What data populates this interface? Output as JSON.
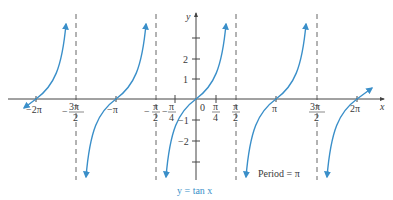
{
  "figure": {
    "curve_label": "y = tan x",
    "annotation": "Period = π",
    "colors": {
      "curve": "#3a8fc9",
      "axis": "#444444",
      "asymptote": "#555555",
      "text": "#3a3a3a"
    }
  },
  "axes": {
    "x_label": "x",
    "y_label": "y",
    "x_ticks": [
      {
        "value": "-2π",
        "label": "−2π"
      },
      {
        "value": "-3π/2",
        "label_num": "3π",
        "label_den": "2",
        "sign": "−"
      },
      {
        "value": "-π",
        "label": "−π"
      },
      {
        "value": "-π/2",
        "label_num": "π",
        "label_den": "2",
        "sign": "−"
      },
      {
        "value": "-π/4",
        "label_num": "π",
        "label_den": "4",
        "sign": "−"
      },
      {
        "value": "0",
        "label": "0"
      },
      {
        "value": "π/4",
        "label_num": "π",
        "label_den": "4"
      },
      {
        "value": "π/2",
        "label_num": "π",
        "label_den": "2"
      },
      {
        "value": "π",
        "label": "π"
      },
      {
        "value": "3π/2",
        "label_num": "3π",
        "label_den": "2"
      },
      {
        "value": "2π",
        "label": "2π"
      }
    ],
    "y_ticks": [
      {
        "value": 3,
        "label": ""
      },
      {
        "value": 2,
        "label": "2"
      },
      {
        "value": 1,
        "label": "1"
      },
      {
        "value": -1,
        "label": "−1"
      },
      {
        "value": -2,
        "label": "−2"
      },
      {
        "value": -3,
        "label": ""
      }
    ]
  },
  "asymptotes": [
    "-3π/2",
    "-π/2",
    "π/2",
    "3π/2"
  ],
  "labels": {
    "neg2pi": "−2π",
    "negpi": "−π",
    "pi": "π",
    "twopi": "2π",
    "zero": "0",
    "minus": "−",
    "pi_sym": "π",
    "threepi": "3π",
    "two": "2",
    "four": "4",
    "y1": "1",
    "y2": "2",
    "yn1": "−1",
    "yn2": "−2",
    "x": "x",
    "y": "y"
  }
}
